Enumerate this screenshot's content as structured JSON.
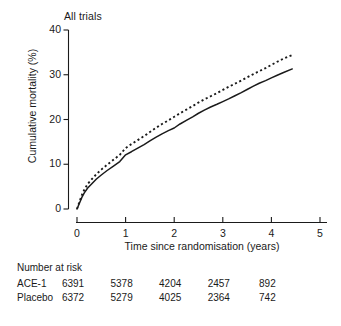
{
  "chart_data": {
    "type": "line",
    "title": "All trials",
    "xlabel": "Time since randomisation (years)",
    "ylabel": "Cumulative mortality (%)",
    "xlim": [
      0,
      5
    ],
    "ylim": [
      0,
      40
    ],
    "xticks": [
      "0",
      "1",
      "2",
      "3",
      "4",
      "5"
    ],
    "yticks": [
      "0",
      "10",
      "20",
      "30",
      "40"
    ],
    "grid": false,
    "legend_position": "none",
    "series": [
      {
        "name": "ACE-1",
        "style": "solid",
        "color": "#1a1a1a",
        "x": [
          0.0,
          0.05,
          0.1,
          0.15,
          0.22,
          0.3,
          0.4,
          0.5,
          0.62,
          0.75,
          0.88,
          1.0,
          1.12,
          1.25,
          1.38,
          1.5,
          1.62,
          1.75,
          1.88,
          2.0,
          2.12,
          2.25,
          2.38,
          2.5,
          2.62,
          2.75,
          2.88,
          3.0,
          3.12,
          3.25,
          3.38,
          3.5,
          3.62,
          3.75,
          3.88,
          4.0,
          4.12,
          4.25,
          4.43
        ],
        "y": [
          0.0,
          1.3,
          2.6,
          3.6,
          4.7,
          5.6,
          6.7,
          7.6,
          8.6,
          9.6,
          10.6,
          12.1,
          12.8,
          13.6,
          14.4,
          15.2,
          16.0,
          16.8,
          17.5,
          18.1,
          19.0,
          19.8,
          20.6,
          21.4,
          22.1,
          22.8,
          23.4,
          24.0,
          24.6,
          25.3,
          26.0,
          26.7,
          27.4,
          28.1,
          28.7,
          29.3,
          29.9,
          30.5,
          31.3
        ]
      },
      {
        "name": "Placebo",
        "style": "dotted",
        "color": "#1a1a1a",
        "x": [
          0.0,
          0.05,
          0.1,
          0.15,
          0.22,
          0.3,
          0.4,
          0.5,
          0.62,
          0.75,
          0.88,
          1.0,
          1.12,
          1.25,
          1.38,
          1.5,
          1.62,
          1.75,
          1.88,
          2.0,
          2.12,
          2.25,
          2.38,
          2.5,
          2.62,
          2.75,
          2.88,
          3.0,
          3.12,
          3.25,
          3.38,
          3.5,
          3.62,
          3.75,
          3.88,
          4.0,
          4.12,
          4.25,
          4.43
        ],
        "y": [
          0.0,
          1.6,
          3.1,
          4.3,
          5.6,
          6.6,
          7.8,
          8.8,
          9.9,
          11.0,
          12.1,
          13.6,
          14.5,
          15.4,
          16.3,
          17.2,
          18.1,
          19.0,
          19.8,
          20.6,
          21.4,
          22.2,
          23.0,
          23.8,
          24.5,
          25.2,
          25.9,
          26.6,
          27.3,
          28.0,
          28.7,
          29.4,
          30.1,
          30.8,
          31.5,
          32.2,
          32.9,
          33.6,
          34.4
        ]
      }
    ]
  },
  "risk_table": {
    "heading": "Number at risk",
    "columns": [
      "0",
      "1",
      "2",
      "3",
      "4"
    ],
    "rows": [
      {
        "label": "ACE-1",
        "values": [
          "6391",
          "5378",
          "4204",
          "2457",
          "892"
        ]
      },
      {
        "label": "Placebo",
        "values": [
          "6372",
          "5279",
          "4025",
          "2364",
          "742"
        ]
      }
    ]
  }
}
